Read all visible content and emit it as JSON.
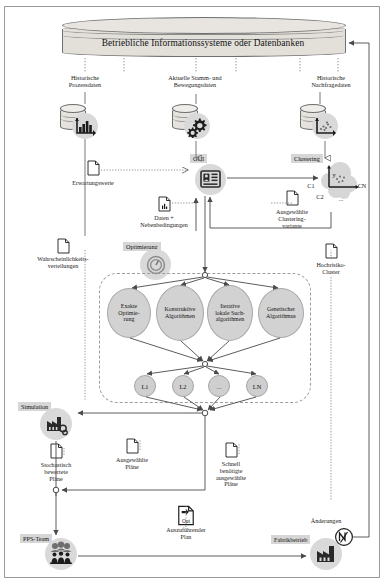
{
  "diagram": {
    "title": "Betriebliche Informationssysteme oder Datenbanken",
    "language": "de"
  },
  "datasources": [
    {
      "id": "historische-prozessdaten",
      "label": "Historische\nProzessdaten",
      "label_line1": "Historische",
      "label_line2": "Prozessdaten",
      "icon": "database-bar-chart-icon"
    },
    {
      "id": "aktuelle-stamm-bewegungsdaten",
      "label_line1": "Aktuelle Stamm- und",
      "label_line2": "Bewegungsdaten",
      "icon": "database-gears-icon"
    },
    {
      "id": "historische-nachfragedaten",
      "label_line1": "Historische",
      "label_line2": "Nachfragedaten",
      "icon": "database-scatter-icon"
    }
  ],
  "tags": {
    "gui": "GUI",
    "clustering": "Clustering",
    "optimierung": "Optimierung",
    "simulation": "Simulation",
    "pps_team": "PPS-Team",
    "fabrikbetrieb": "Fabrikbetrieb"
  },
  "documents": {
    "erwartungswerte": "Erwartungswerte",
    "daten_neben_l1": "Daten +",
    "daten_neben_l2": "Nebenbedingungen",
    "ausgewaehlte_clustering_l1": "Ausgewählte",
    "ausgewaehlte_clustering_l2": "Clustering-",
    "ausgewaehlte_clustering_l3": "variante",
    "wahrscheinlichkeits_l1": "Wahrscheinlichkeits-",
    "wahrscheinlichkeits_l2": "verteilungen",
    "hochrisiko_l1": "Hochrisiko-",
    "hochrisiko_l2": "Cluster",
    "stochastisch_l1": "Stochastisch",
    "stochastisch_l2": "bewertete",
    "stochastisch_l3": "Pläne",
    "ausgewaehlte_plaene_l1": "Ausgewählte",
    "ausgewaehlte_plaene_l2": "Pläne",
    "schnell_l1": "Schnell",
    "schnell_l2": "benötigte",
    "schnell_l3": "ausgewählte",
    "schnell_l4": "Pläne",
    "auszufuehrender_badge": "Out",
    "auszufuehrender_l1": "Auszuführender",
    "auszufuehrender_l2": "Plan",
    "aenderungen": "Änderungen"
  },
  "clustering_icon": {
    "c1": "C1",
    "c2": "C2",
    "cn": "CN",
    "dots": "...",
    "y_axis": "y"
  },
  "algorithms": [
    {
      "id": "exakte-optimierung",
      "l1": "Exakte",
      "l2": "Optimie-",
      "l3": "rung"
    },
    {
      "id": "konstruktive-algorithmen",
      "l1": "Konstruktive",
      "l2": "Algorithmen",
      "l3": ""
    },
    {
      "id": "iterative-lokale-suchalgorithmen",
      "l1": "Iterative",
      "l2": "lokale Such-",
      "l3": "algorithmen"
    },
    {
      "id": "genetischer-algorithmus",
      "l1": "Genetischer",
      "l2": "Algorithmus",
      "l3": ""
    }
  ],
  "plan_nodes": [
    {
      "id": "l1",
      "label": "L1"
    },
    {
      "id": "l2",
      "label": "L2"
    },
    {
      "id": "ldots",
      "label": "..."
    },
    {
      "id": "ln",
      "label": "LN"
    }
  ],
  "colors": {
    "badge_grey": "#d9d9d9",
    "ellipse_grey": "#d2d2d2",
    "cylinder": "#e3e0da",
    "tag_bg": "#d6d6d6",
    "line": "#555555",
    "dashed": "#9c9c9c"
  }
}
